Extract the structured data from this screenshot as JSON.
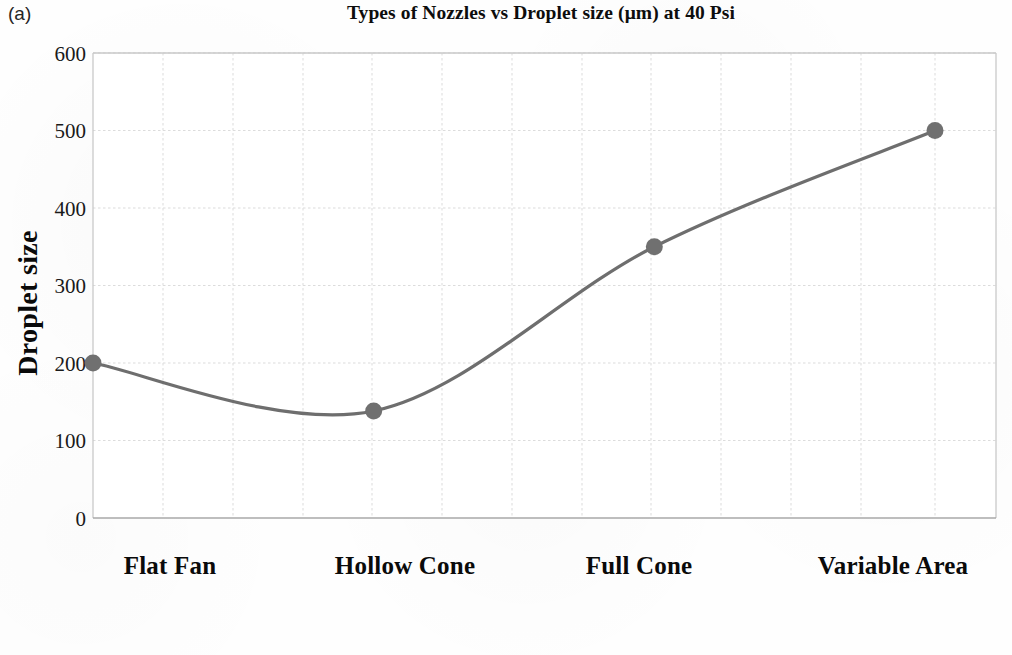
{
  "panel_label": "(a)",
  "chart_data": {
    "type": "line",
    "title": "Types of Nozzles vs Droplet size (μm) at 40 Psi",
    "xlabel": "Type of nozzles",
    "ylabel": "Droplet size",
    "categories": [
      "Flat Fan",
      "Hollow Cone",
      "Full Cone",
      "Variable Area"
    ],
    "values": [
      200,
      138,
      350,
      500
    ],
    "series": [
      {
        "name": "Droplet size",
        "values": [
          200,
          138,
          350,
          500
        ]
      }
    ],
    "ylim": [
      0,
      600
    ],
    "y_ticks": [
      0,
      100,
      200,
      300,
      400,
      500,
      600
    ],
    "y_tick_labels": [
      "0",
      "100",
      "200",
      "300",
      "400",
      "500",
      "600"
    ],
    "grid": true,
    "grid_x": true,
    "grid_y": true,
    "legend": false,
    "legend_position": "none",
    "smoothing": "spline",
    "marker": "circle",
    "line_color": "#6e6e6e",
    "marker_color": "#707070",
    "grid_color": "#dcdcdc",
    "axis_color": "#c9c9c9",
    "plot_background": "#ffffff"
  }
}
